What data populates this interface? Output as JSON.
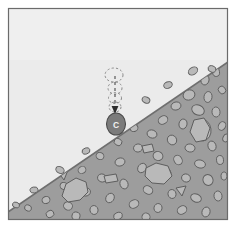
{
  "figure": {
    "name": "clast-on-slope-diagram",
    "type": "scanned-line-diagram",
    "canvas": {
      "width": 236,
      "height": 228
    },
    "frame": {
      "name": "figure-border",
      "x": 8,
      "y": 8,
      "width": 220,
      "height": 212,
      "border_color": "#6b6b6b",
      "margin_color": "#ffffff"
    },
    "colors": {
      "sky": "#ebebeb",
      "sky_shadow": "#e2e2e2",
      "ground": "#9d9d9d",
      "ground_edge": "#6f6f6f",
      "clast_fill": "#b9b9b9",
      "clast_outline": "#5e5e5e",
      "object_fill": "#7b7b7b",
      "object_outline": "#4a4a4a",
      "ghost_outline": "#8a8a8a",
      "trajectory": "#4a4a4a",
      "label_text": "#f2f2f2"
    },
    "regions": [
      {
        "name": "sky-region",
        "label": "air / free-fall space above slope",
        "fill": "#ebebeb"
      },
      {
        "name": "slope-region",
        "label": "debris-mantled slope surface with embedded clasts",
        "fill": "#9d9d9d",
        "slope_line": {
          "x1": 8,
          "y1": 212,
          "x2": 228,
          "y2": 62
        }
      }
    ],
    "annotations": {
      "falling_object": {
        "name": "clast-c",
        "label": "C",
        "cx": 116,
        "cy": 124,
        "rx": 9.5,
        "ry": 11,
        "description": "dark rounded clast resting on slope surface, labelled C"
      },
      "trajectory": {
        "name": "fall-trajectory",
        "description": "vertical dashed line with downward arrowhead showing fall path",
        "x": 115,
        "y_top": 78,
        "y_bottom": 112,
        "arrow_tip_y": 112,
        "dash_pattern": "3,3"
      },
      "ghost_positions": [
        {
          "name": "ghost-position-1",
          "cx": 114,
          "cy": 75,
          "rx": 9,
          "ry": 7
        },
        {
          "name": "ghost-position-2",
          "cx": 115,
          "cy": 88,
          "rx": 7,
          "ry": 6
        },
        {
          "name": "ghost-position-3",
          "cx": 115,
          "cy": 98,
          "rx": 6.5,
          "ry": 5.5
        },
        {
          "name": "ghost-position-4",
          "cx": 115,
          "cy": 107,
          "rx": 6,
          "ry": 5
        }
      ]
    },
    "clasts": [
      {
        "cx": 191,
        "cy": 74,
        "rx": 5,
        "ry": 4,
        "rot": -28
      },
      {
        "cx": 205,
        "cy": 80,
        "rx": 4,
        "ry": 5,
        "rot": 15
      },
      {
        "cx": 216,
        "cy": 72,
        "rx": 3.5,
        "ry": 4.5,
        "rot": -10
      },
      {
        "cx": 172,
        "cy": 86,
        "rx": 4.5,
        "ry": 3.5,
        "rot": 35
      },
      {
        "cx": 189,
        "cy": 95,
        "rx": 6,
        "ry": 5,
        "rot": -20
      },
      {
        "cx": 208,
        "cy": 97,
        "rx": 4,
        "ry": 5.5,
        "rot": 8
      },
      {
        "cx": 222,
        "cy": 90,
        "rx": 3.5,
        "ry": 4,
        "rot": -40
      },
      {
        "cx": 160,
        "cy": 100,
        "rx": 4,
        "ry": 3.5,
        "rot": 20
      },
      {
        "cx": 176,
        "cy": 106,
        "rx": 5,
        "ry": 4,
        "rot": -15
      },
      {
        "cx": 198,
        "cy": 110,
        "rx": 6.5,
        "ry": 5,
        "rot": 25
      },
      {
        "cx": 216,
        "cy": 112,
        "rx": 4,
        "ry": 5,
        "rot": -5
      },
      {
        "cx": 147,
        "cy": 112,
        "rx": 3.5,
        "ry": 4,
        "rot": 40
      },
      {
        "cx": 163,
        "cy": 120,
        "rx": 5,
        "ry": 4,
        "rot": -30
      },
      {
        "cx": 183,
        "cy": 124,
        "rx": 4,
        "ry": 5,
        "rot": 12
      },
      {
        "cx": 202,
        "cy": 130,
        "rx": 9,
        "ry": 11,
        "rot": -8
      },
      {
        "cx": 222,
        "cy": 126,
        "rx": 3.5,
        "ry": 4.5,
        "rot": 30
      },
      {
        "cx": 134,
        "cy": 128,
        "rx": 4,
        "ry": 3.5,
        "rot": -22
      },
      {
        "cx": 152,
        "cy": 134,
        "rx": 5,
        "ry": 4,
        "rot": 18
      },
      {
        "cx": 172,
        "cy": 140,
        "rx": 4.5,
        "ry": 5,
        "rot": -35
      },
      {
        "cx": 190,
        "cy": 148,
        "rx": 5,
        "ry": 4,
        "rot": 10
      },
      {
        "cx": 212,
        "cy": 146,
        "rx": 4,
        "ry": 5,
        "rot": -18
      },
      {
        "cx": 226,
        "cy": 138,
        "rx": 3,
        "ry": 4,
        "rot": 25
      },
      {
        "cx": 118,
        "cy": 142,
        "rx": 4,
        "ry": 3.5,
        "rot": 33
      },
      {
        "cx": 138,
        "cy": 148,
        "rx": 4.5,
        "ry": 4,
        "rot": -12
      },
      {
        "cx": 158,
        "cy": 156,
        "rx": 5,
        "ry": 4.5,
        "rot": 22
      },
      {
        "cx": 178,
        "cy": 160,
        "rx": 4,
        "ry": 5,
        "rot": -28
      },
      {
        "cx": 200,
        "cy": 164,
        "rx": 5.5,
        "ry": 4,
        "rot": 14
      },
      {
        "cx": 220,
        "cy": 160,
        "rx": 3.5,
        "ry": 4.5,
        "rot": -6
      },
      {
        "cx": 100,
        "cy": 156,
        "rx": 4,
        "ry": 3.5,
        "rot": 28
      },
      {
        "cx": 120,
        "cy": 162,
        "rx": 5,
        "ry": 4,
        "rot": -16
      },
      {
        "cx": 142,
        "cy": 168,
        "rx": 4,
        "ry": 5,
        "rot": 36
      },
      {
        "cx": 163,
        "cy": 174,
        "rx": 8,
        "ry": 7,
        "rot": -10
      },
      {
        "cx": 186,
        "cy": 178,
        "rx": 4.5,
        "ry": 4,
        "rot": 20
      },
      {
        "cx": 208,
        "cy": 180,
        "rx": 5,
        "ry": 5.5,
        "rot": -24
      },
      {
        "cx": 224,
        "cy": 176,
        "rx": 3,
        "ry": 4,
        "rot": 8
      },
      {
        "cx": 82,
        "cy": 170,
        "rx": 4,
        "ry": 3.5,
        "rot": -32
      },
      {
        "cx": 102,
        "cy": 178,
        "rx": 4.5,
        "ry": 4,
        "rot": 16
      },
      {
        "cx": 124,
        "cy": 184,
        "rx": 4,
        "ry": 5,
        "rot": -20
      },
      {
        "cx": 148,
        "cy": 190,
        "rx": 5,
        "ry": 4,
        "rot": 30
      },
      {
        "cx": 172,
        "cy": 194,
        "rx": 4,
        "ry": 4.5,
        "rot": -14
      },
      {
        "cx": 196,
        "cy": 198,
        "rx": 5.5,
        "ry": 4,
        "rot": 22
      },
      {
        "cx": 218,
        "cy": 196,
        "rx": 4,
        "ry": 5,
        "rot": -8
      },
      {
        "cx": 64,
        "cy": 186,
        "rx": 4,
        "ry": 3.5,
        "rot": 26
      },
      {
        "cx": 86,
        "cy": 192,
        "rx": 4.5,
        "ry": 4,
        "rot": -18
      },
      {
        "cx": 110,
        "cy": 198,
        "rx": 4,
        "ry": 5,
        "rot": 34
      },
      {
        "cx": 134,
        "cy": 204,
        "rx": 5,
        "ry": 4,
        "rot": -26
      },
      {
        "cx": 158,
        "cy": 208,
        "rx": 4,
        "ry": 4.5,
        "rot": 12
      },
      {
        "cx": 182,
        "cy": 210,
        "rx": 5,
        "ry": 4,
        "rot": -30
      },
      {
        "cx": 206,
        "cy": 212,
        "rx": 4,
        "ry": 5,
        "rot": 18
      },
      {
        "cx": 46,
        "cy": 200,
        "rx": 4,
        "ry": 3.5,
        "rot": -22
      },
      {
        "cx": 68,
        "cy": 206,
        "rx": 4.5,
        "ry": 4,
        "rot": 28
      },
      {
        "cx": 94,
        "cy": 210,
        "rx": 4,
        "ry": 4.5,
        "rot": -12
      },
      {
        "cx": 28,
        "cy": 208,
        "rx": 3.5,
        "ry": 3,
        "rot": 20
      },
      {
        "cx": 50,
        "cy": 214,
        "rx": 4,
        "ry": 3.5,
        "rot": -34
      },
      {
        "cx": 76,
        "cy": 216,
        "rx": 4,
        "ry": 4,
        "rot": 14
      },
      {
        "cx": 118,
        "cy": 216,
        "rx": 4.5,
        "ry": 3.5,
        "rot": -20
      },
      {
        "cx": 146,
        "cy": 217,
        "rx": 4,
        "ry": 4,
        "rot": 25
      }
    ],
    "angular_clasts": [
      {
        "name": "angular-clast-crescent",
        "points": "62,196 66,184 76,178 86,182 88,192 80,200 68,202",
        "rot": 0
      },
      {
        "name": "angular-clast-large-blob",
        "points": "146,168 156,163 168,166 172,176 164,184 152,183 145,176"
      },
      {
        "name": "angular-clast-oval-right",
        "points": "194,120 204,118 210,128 206,140 196,142 190,132"
      },
      {
        "name": "angular-clast-rect-a",
        "points": "104,176 116,174 118,181 106,183"
      },
      {
        "name": "angular-clast-rect-b",
        "points": "142,146 152,144 154,151 144,153"
      },
      {
        "name": "angular-clast-tri-a",
        "points": "176,188 186,186 182,196"
      },
      {
        "name": "angular-clast-tri-b",
        "points": "58,172 68,170 64,180"
      }
    ]
  }
}
